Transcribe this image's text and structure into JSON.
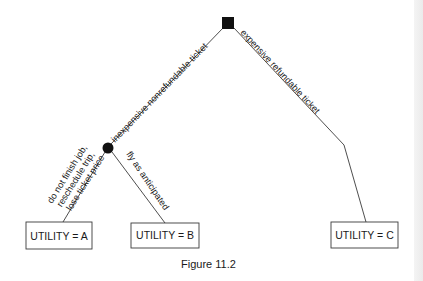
{
  "figure": {
    "caption": "Figure 11.2",
    "colors": {
      "line": "#3a3a3a",
      "node_fill": "#111111",
      "text": "#1a1a1a",
      "background": "#ffffff"
    }
  },
  "nodes": {
    "decision": {
      "type": "decision-square"
    },
    "chance": {
      "type": "chance-circle"
    }
  },
  "branches": {
    "left": {
      "label": "inexpensive nonrefundable ticket"
    },
    "right": {
      "label": "expensive refundable ticket"
    },
    "chance_left": {
      "label_lines": [
        "do not finish job,",
        "reschedule trip,",
        "lose ticket price"
      ]
    },
    "chance_right": {
      "label": "fly as anticipated"
    }
  },
  "outcomes": [
    {
      "id": "A",
      "label": "UTILITY = A"
    },
    {
      "id": "B",
      "label": "UTILITY = B"
    },
    {
      "id": "C",
      "label": "UTILITY = C"
    }
  ]
}
